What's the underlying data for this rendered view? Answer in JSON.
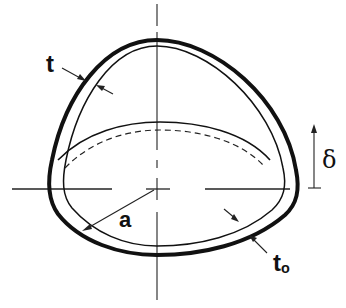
{
  "figure": {
    "labels": {
      "t": "t",
      "a": "a",
      "t0_main": "t",
      "t0_sub": "o",
      "delta": "δ"
    },
    "colors": {
      "ink": "#111111",
      "background": "#ffffff"
    }
  }
}
